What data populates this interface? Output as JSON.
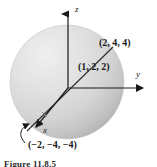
{
  "figure": {
    "kind": "3d-coordinate-sphere-diagram",
    "caption": "Figure 11.8.5",
    "axes": {
      "z_label": "z",
      "y_label": "y",
      "x_label": "x"
    },
    "labels": {
      "upper_point": "(2, 4, 4)",
      "mid_point": "(1, 2, 2)",
      "lower_point": "(−2, −4, −4)"
    },
    "colors": {
      "sphere_light": "#e8e8e8",
      "sphere_mid": "#d2d2d2",
      "sphere_dark": "#b4b4b4",
      "stroke": "#1a1a1a",
      "background": "#ffffff"
    },
    "geometry": {
      "sphere_center_x": 67,
      "sphere_center_y": 82,
      "sphere_radius": 57,
      "origin_x": 68,
      "origin_y": 88
    }
  }
}
